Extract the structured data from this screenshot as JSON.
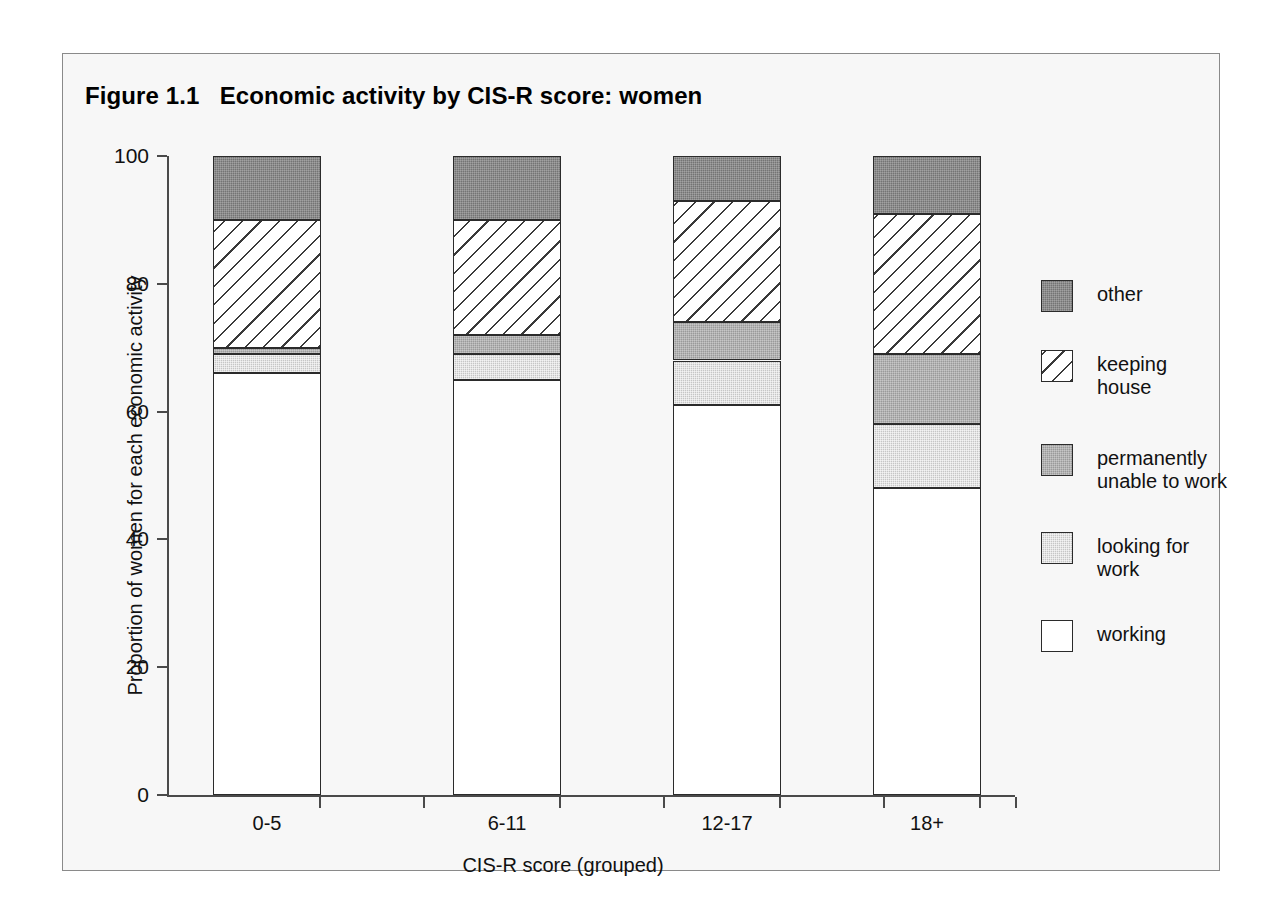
{
  "figure": {
    "title": "Figure 1.1   Economic activity by CIS-R score: women",
    "frame_border_color": "#8a8a8a",
    "background_color": "#f7f7f7"
  },
  "axes": {
    "y_title": "Proportion of women for each economic activity",
    "x_title": "CIS-R score (grouped)",
    "y_ticks": [
      "0",
      "20",
      "40",
      "60",
      "80",
      "100"
    ],
    "x_ticks": [
      "0-5",
      "6-11",
      "12-17",
      "18+"
    ]
  },
  "legend": {
    "items": [
      {
        "label": "other",
        "fill": "other",
        "color": "#747474"
      },
      {
        "label": "keeping\nhouse",
        "fill": "keeping",
        "color": "#ffffff"
      },
      {
        "label": "permanently\nunable to work",
        "fill": "unable",
        "color": "#9a9a9a"
      },
      {
        "label": "looking for\nwork",
        "fill": "looking",
        "color": "#c6c6c6"
      },
      {
        "label": "working",
        "fill": "working",
        "color": "#ffffff"
      }
    ]
  },
  "chart_data": {
    "type": "bar",
    "subtype": "stacked-100-percent",
    "title": "Figure 1.1   Economic activity by CIS-R score: women",
    "xlabel": "CIS-R score (grouped)",
    "ylabel": "Proportion of women for each economic activity",
    "ylim": [
      0,
      100
    ],
    "yticks": [
      0,
      20,
      40,
      60,
      80,
      100
    ],
    "grid": false,
    "legend_position": "right",
    "categories": [
      "0-5",
      "6-11",
      "12-17",
      "18+"
    ],
    "series": [
      {
        "name": "working",
        "fill": "working",
        "values": [
          66,
          65,
          61,
          48
        ]
      },
      {
        "name": "looking for work",
        "fill": "looking",
        "values": [
          3,
          4,
          7,
          10
        ]
      },
      {
        "name": "permanently unable to work",
        "fill": "unable",
        "values": [
          1,
          3,
          6,
          11
        ]
      },
      {
        "name": "keeping house",
        "fill": "keeping",
        "values": [
          20,
          18,
          19,
          22
        ]
      },
      {
        "name": "other",
        "fill": "other",
        "values": [
          10,
          10,
          7,
          9
        ]
      }
    ],
    "cumulative_tops": {
      "0-5": {
        "working": 66,
        "looking for work": 69,
        "permanently unable to work": 70,
        "keeping house": 90,
        "other": 100
      },
      "6-11": {
        "working": 65,
        "looking for work": 69,
        "permanently unable to work": 72,
        "keeping house": 90,
        "other": 100
      },
      "12-17": {
        "working": 61,
        "looking for work": 68,
        "permanently unable to work": 74,
        "keeping house": 93,
        "other": 100
      },
      "18+": {
        "working": 48,
        "looking for work": 58,
        "permanently unable to work": 69,
        "keeping house": 91,
        "other": 100
      }
    }
  }
}
